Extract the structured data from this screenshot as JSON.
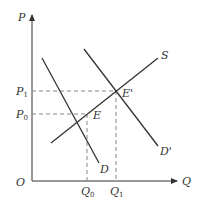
{
  "diagram": {
    "type": "supply-demand",
    "axes": {
      "y_label": "P",
      "x_label": "Q",
      "origin_label": "O"
    },
    "price_levels": [
      {
        "base": "P",
        "sub": "1",
        "y": 91
      },
      {
        "base": "P",
        "sub": "0",
        "y": 114
      }
    ],
    "quantity_levels": [
      {
        "base": "Q",
        "sub": "0",
        "x": 87
      },
      {
        "base": "Q",
        "sub": "1",
        "x": 116
      }
    ],
    "curves": [
      {
        "name": "S",
        "label": "S",
        "x1": 51,
        "y1": 143,
        "x2": 158,
        "y2": 58
      },
      {
        "name": "D",
        "label": "D",
        "x1": 42,
        "y1": 58,
        "x2": 99,
        "y2": 163
      },
      {
        "name": "D-prime",
        "label": "D'",
        "x1": 84,
        "y1": 49,
        "x2": 158,
        "y2": 146
      }
    ],
    "equilibria": [
      {
        "label": "E",
        "x": 87,
        "y": 114
      },
      {
        "label": "E'",
        "x": 116,
        "y": 91
      }
    ],
    "colors": {
      "line": "#333333",
      "dashed": "#888888"
    }
  }
}
